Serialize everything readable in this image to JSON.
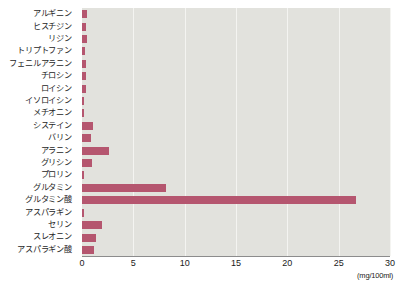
{
  "chart_data": {
    "type": "bar",
    "orientation": "horizontal",
    "title": "",
    "xlabel": "(mg/100ml)",
    "ylabel": "",
    "xlim": [
      0,
      30
    ],
    "xticks": [
      0,
      5,
      10,
      15,
      20,
      25,
      30
    ],
    "xtick_labels": [
      "0",
      "5",
      "10",
      "15",
      "20",
      "25",
      "30"
    ],
    "grid": true,
    "grid_axis": "x",
    "legend": false,
    "bar_color": "#b5566f",
    "plot_background": "#e2e2dd",
    "categories": [
      "アルギニン",
      "ヒスチジン",
      "リジン",
      "トリプトファン",
      "フェニルアラニン",
      "チロシン",
      "ロイシン",
      "イソロイシン",
      "メチオニン",
      "システイン",
      "バリン",
      "アラニン",
      "グリシン",
      "プロリン",
      "グルタミン",
      "グルタミン酸",
      "アスパラギン",
      "セリン",
      "スレオニン",
      "アスパラギン酸"
    ],
    "values": [
      0.5,
      0.4,
      0.5,
      0.3,
      0.4,
      0.4,
      0.4,
      0.2,
      0.2,
      1.1,
      0.9,
      2.6,
      1.0,
      0.2,
      8.2,
      26.7,
      0.2,
      1.9,
      1.4,
      1.2
    ],
    "unit": "mg/100ml"
  }
}
